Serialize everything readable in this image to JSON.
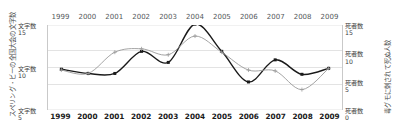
{
  "chart_data": {
    "type": "line",
    "title": "",
    "xlabel": "",
    "ylabel": "スペリング・ビーの全国大会の文字数",
    "y2label": "毒グモに刺されて死ぬ人数",
    "categories": [
      "1999",
      "2000",
      "2001",
      "2002",
      "2003",
      "2004",
      "2005",
      "2006",
      "2007",
      "2008",
      "2009"
    ],
    "grid": true,
    "legend_position": "none",
    "ylim": [
      5,
      15
    ],
    "y2lim": [
      0,
      15
    ],
    "y_ticks": [
      {
        "name": "文字数",
        "value": "15"
      },
      {
        "name": "文字数",
        "value": "10"
      },
      {
        "name": "文字数",
        "value": "5"
      }
    ],
    "y2_ticks": [
      {
        "name": "死者数",
        "value": "15"
      },
      {
        "name": "死者数",
        "value": "10"
      },
      {
        "name": "死者数",
        "value": "5"
      },
      {
        "name": "死者数",
        "value": "0"
      }
    ],
    "series": [
      {
        "name": "スペリング・ビーの全国大会の文字数",
        "axis": "left",
        "color": "#1a1a1a",
        "marker": "square",
        "values": [
          9.8,
          9.3,
          9.3,
          11.9,
          10.6,
          15.1,
          11.9,
          8.3,
          10.9,
          9.2,
          9.9
        ]
      },
      {
        "name": "毒グモに刺されて死ぬ人数",
        "axis": "right",
        "color": "#9a9a9a",
        "marker": "plus",
        "values": [
          9.7,
          9.3,
          11.8,
          12.2,
          11.5,
          13.7,
          11.8,
          9.7,
          9.6,
          7.4,
          9.9
        ]
      }
    ]
  },
  "axes": {
    "left_title": "スペリング・ビーの全国大会の文字数",
    "right_title": "毒グモに刺されて死ぬ人数"
  },
  "years_top": [
    "1999",
    "2000",
    "2001",
    "2002",
    "2003",
    "2004",
    "2005",
    "2006",
    "2007",
    "2008",
    "2009"
  ],
  "years_bottom": [
    "1999",
    "2000",
    "2001",
    "2002",
    "2003",
    "2004",
    "2005",
    "2006",
    "2007",
    "2008",
    "2009"
  ],
  "colors": {
    "series_primary": "#1a1a1a",
    "series_secondary": "#9a9a9a",
    "gridline": "#dcdcdc",
    "axis_line": "#c9c9c9",
    "background": "#ffffff"
  }
}
